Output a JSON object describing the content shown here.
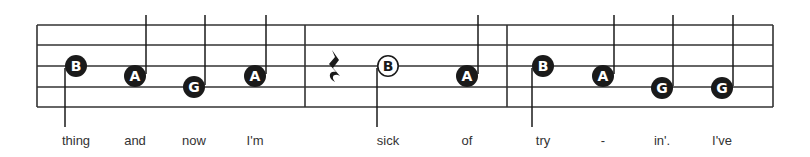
{
  "score": {
    "colors": {
      "ink": "#1a1a1a",
      "staff": "#333333",
      "paper": "#ffffff",
      "lyric": "#333333"
    },
    "staff": {
      "x_start": 37,
      "x_end": 773,
      "lines_y": [
        25,
        45,
        66,
        87,
        107
      ]
    },
    "barlines_x": [
      37,
      305,
      507,
      773
    ],
    "rest": {
      "type": "quarter-rest",
      "x": 334,
      "y": 66
    },
    "notes": [
      {
        "letter": "B",
        "x": 76,
        "y": 66,
        "filled": true,
        "stem": "down",
        "lyric": "thing"
      },
      {
        "letter": "A",
        "x": 135,
        "y": 76,
        "filled": true,
        "stem": "up",
        "lyric": "and"
      },
      {
        "letter": "G",
        "x": 194,
        "y": 87,
        "filled": true,
        "stem": "up",
        "lyric": "now"
      },
      {
        "letter": "A",
        "x": 255,
        "y": 76,
        "filled": true,
        "stem": "up",
        "lyric": "I'm"
      },
      {
        "letter": "B",
        "x": 388,
        "y": 66,
        "filled": false,
        "stem": "down",
        "lyric": "sick"
      },
      {
        "letter": "A",
        "x": 467,
        "y": 76,
        "filled": true,
        "stem": "up",
        "lyric": "of"
      },
      {
        "letter": "B",
        "x": 543,
        "y": 66,
        "filled": true,
        "stem": "down",
        "lyric": "try"
      },
      {
        "letter": "A",
        "x": 603,
        "y": 76,
        "filled": true,
        "stem": "up",
        "lyric": "-"
      },
      {
        "letter": "G",
        "x": 662,
        "y": 88,
        "filled": true,
        "stem": "up",
        "lyric": "in'."
      },
      {
        "letter": "G",
        "x": 722,
        "y": 88,
        "filled": true,
        "stem": "up",
        "lyric": "I've"
      }
    ]
  },
  "lyrics": [
    "thing",
    "and",
    "now",
    "I'm",
    "sick",
    "of",
    "try",
    "-",
    "in'.",
    "I've"
  ]
}
